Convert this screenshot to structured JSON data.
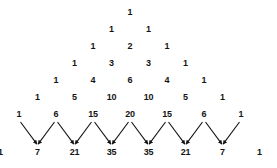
{
  "figure": {
    "name": "pascals-triangle",
    "background_color": "#ffffff",
    "text_color": "#141414",
    "arrow_color": "#141414"
  },
  "layout": {
    "width": 277,
    "height": 168,
    "apex_x": 130,
    "apex_y": 12,
    "column_spacing": 37,
    "row_spacing": 17,
    "last_row_gap": 38
  },
  "chart_data": {
    "type": "table",
    "rows": [
      {
        "index": 0,
        "values": [
          1
        ]
      },
      {
        "index": 1,
        "values": [
          1,
          1
        ]
      },
      {
        "index": 2,
        "values": [
          1,
          2,
          1
        ]
      },
      {
        "index": 3,
        "values": [
          1,
          3,
          3,
          1
        ]
      },
      {
        "index": 4,
        "values": [
          1,
          4,
          6,
          4,
          1
        ]
      },
      {
        "index": 5,
        "values": [
          1,
          5,
          10,
          10,
          5,
          1
        ]
      },
      {
        "index": 6,
        "values": [
          1,
          6,
          15,
          20,
          15,
          6,
          1
        ]
      },
      {
        "index": 7,
        "values": [
          1,
          7,
          21,
          35,
          35,
          21,
          7,
          1
        ]
      }
    ],
    "arrows": [
      {
        "from_row": 6,
        "from_index": 0,
        "to_row": 7,
        "to_index": 1
      },
      {
        "from_row": 6,
        "from_index": 1,
        "to_row": 7,
        "to_index": 1
      },
      {
        "from_row": 6,
        "from_index": 1,
        "to_row": 7,
        "to_index": 2
      },
      {
        "from_row": 6,
        "from_index": 2,
        "to_row": 7,
        "to_index": 2
      },
      {
        "from_row": 6,
        "from_index": 2,
        "to_row": 7,
        "to_index": 3
      },
      {
        "from_row": 6,
        "from_index": 3,
        "to_row": 7,
        "to_index": 3
      },
      {
        "from_row": 6,
        "from_index": 3,
        "to_row": 7,
        "to_index": 4
      },
      {
        "from_row": 6,
        "from_index": 4,
        "to_row": 7,
        "to_index": 4
      },
      {
        "from_row": 6,
        "from_index": 4,
        "to_row": 7,
        "to_index": 5
      },
      {
        "from_row": 6,
        "from_index": 5,
        "to_row": 7,
        "to_index": 5
      },
      {
        "from_row": 6,
        "from_index": 5,
        "to_row": 7,
        "to_index": 6
      },
      {
        "from_row": 6,
        "from_index": 6,
        "to_row": 7,
        "to_index": 6
      }
    ]
  }
}
